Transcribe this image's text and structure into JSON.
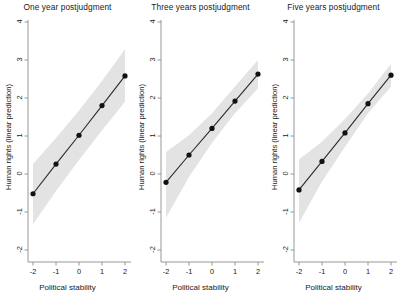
{
  "figure": {
    "background_color": "#ffffff",
    "panel_count": 3,
    "axis_color": "#8c8c8c",
    "line_color": "#2b2b2b",
    "marker_color": "#111111",
    "ci_band_color": "#e3e3e3"
  },
  "chart_data": [
    {
      "type": "line",
      "title": "One year postjudgment",
      "xlabel": "Political stability",
      "ylabel": "Human rights (linear prediction)",
      "x": [
        -2,
        -1,
        0,
        1,
        2
      ],
      "values": [
        -0.52,
        0.26,
        1.02,
        1.8,
        2.58
      ],
      "ci_lower": [
        -1.32,
        -0.45,
        0.37,
        1.15,
        1.9
      ],
      "ci_upper": [
        0.26,
        0.95,
        1.67,
        2.45,
        3.28
      ],
      "xlim": [
        -2.3,
        2.3
      ],
      "ylim": [
        -2,
        4
      ],
      "xticks": [
        -2,
        -1,
        0,
        1,
        2
      ],
      "yticks": [
        -2,
        -1,
        0,
        1,
        2,
        3,
        4
      ],
      "xticklabels": [
        "-2",
        "-1",
        "0",
        "1",
        "2"
      ],
      "yticklabels": [
        "-2",
        "-1",
        "0",
        "1",
        "2",
        "3",
        "4"
      ],
      "grid": false,
      "legend": false
    },
    {
      "type": "line",
      "title": "Three years postjudgment",
      "xlabel": "Political stability",
      "ylabel": "Human rights (linear prediction)",
      "x": [
        -2,
        -1,
        0,
        1,
        2
      ],
      "values": [
        -0.22,
        0.5,
        1.2,
        1.92,
        2.63
      ],
      "ci_lower": [
        -1.15,
        -0.08,
        0.82,
        1.6,
        2.25
      ],
      "ci_upper": [
        0.58,
        1.02,
        1.6,
        2.3,
        3.0
      ],
      "xlim": [
        -2.3,
        2.3
      ],
      "ylim": [
        -2,
        4
      ],
      "xticks": [
        -2,
        -1,
        0,
        1,
        2
      ],
      "yticks": [
        -2,
        -1,
        0,
        1,
        2,
        3,
        4
      ],
      "xticklabels": [
        "-2",
        "-1",
        "0",
        "1",
        "2"
      ],
      "yticklabels": [
        "-2",
        "-1",
        "0",
        "1",
        "2",
        "3",
        "4"
      ],
      "grid": false,
      "legend": false
    },
    {
      "type": "line",
      "title": "Five years postjudgment",
      "xlabel": "Political stability",
      "ylabel": "Human rights (linear prediction)",
      "x": [
        -2,
        -1,
        0,
        1,
        2
      ],
      "values": [
        -0.42,
        0.33,
        1.08,
        1.85,
        2.6
      ],
      "ci_lower": [
        -1.28,
        -0.2,
        0.72,
        1.6,
        2.3
      ],
      "ci_upper": [
        0.38,
        0.85,
        1.45,
        2.12,
        2.9
      ],
      "xlim": [
        -2.3,
        2.3
      ],
      "ylim": [
        -2,
        4
      ],
      "xticks": [
        -2,
        -1,
        0,
        1,
        2
      ],
      "yticks": [
        -2,
        -1,
        0,
        1,
        2,
        3,
        4
      ],
      "xticklabels": [
        "-2",
        "-1",
        "0",
        "1",
        "2"
      ],
      "yticklabels": [
        "-2",
        "-1",
        "0",
        "1",
        "2",
        "3",
        "4"
      ],
      "grid": false,
      "legend": false
    }
  ]
}
